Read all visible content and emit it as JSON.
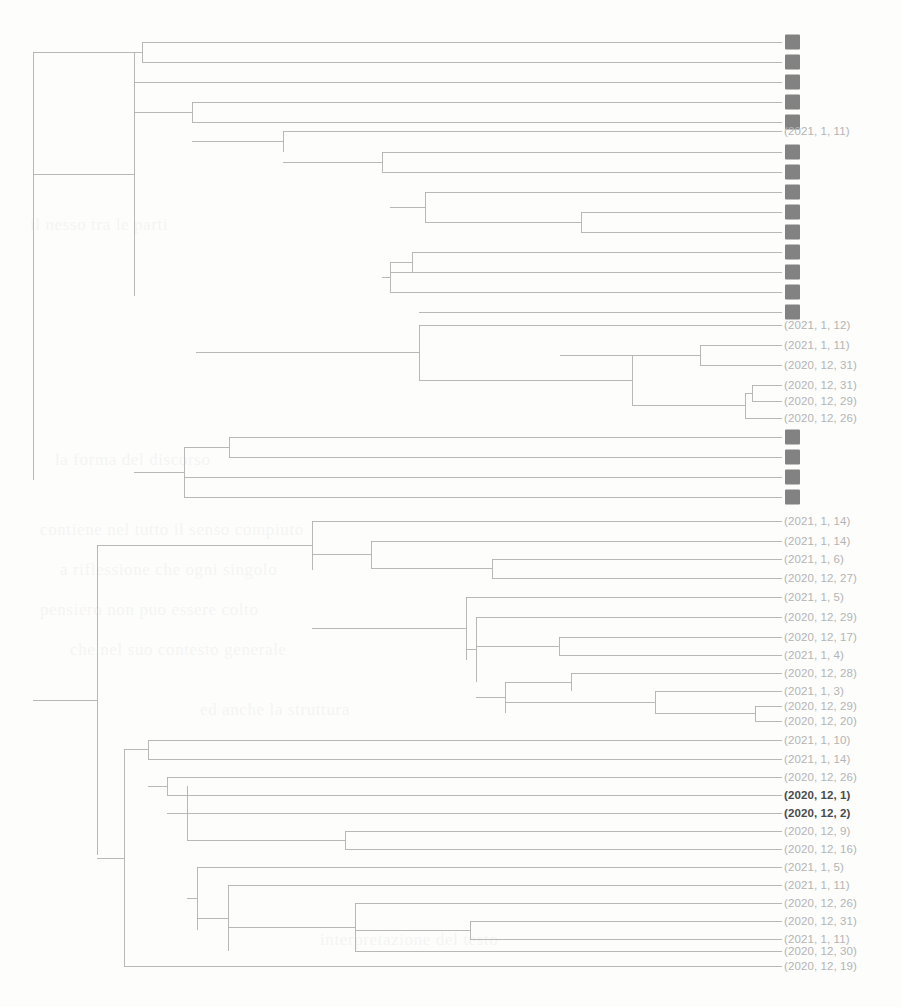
{
  "figure": {
    "type": "dendrogram",
    "title": "",
    "orientation": "left-to-right",
    "background_color": "#fdfdfc",
    "line_color": "#b0b0b0",
    "label_color": "#b4b4b4",
    "redaction_color": "#828282",
    "highlight_color": "#4a4a4a"
  },
  "chart_data": {
    "type": "dendrogram",
    "title": "",
    "xlabel": "",
    "ylabel": "",
    "orientation": "left-to-right",
    "leaf_count": 47,
    "leaf_spacing_px": 20,
    "first_leaf_y": 42,
    "leaf_x": 782,
    "root_x": 33,
    "note": "Hierarchical clustering dendrogram; 25 leaf labels are redacted (solid gray blocks), 22 show date tuples. Two labels are rendered in bold dark text.",
    "leaves": [
      {
        "index": 0,
        "y": 42,
        "label": "",
        "redacted": true,
        "bold": false,
        "branch_x": 142
      },
      {
        "index": 1,
        "y": 62,
        "label": "",
        "redacted": true,
        "bold": false,
        "branch_x": 142
      },
      {
        "index": 2,
        "y": 82,
        "label": "",
        "redacted": true,
        "bold": false,
        "branch_x": 134
      },
      {
        "index": 3,
        "y": 102,
        "label": "",
        "redacted": true,
        "bold": false,
        "branch_x": 192
      },
      {
        "index": 4,
        "y": 122,
        "label": "",
        "redacted": true,
        "bold": false,
        "branch_x": 192
      },
      {
        "index": 5,
        "y": 131,
        "label": "(2021, 1, 11)",
        "redacted": false,
        "bold": false,
        "branch_x": 283
      },
      {
        "index": 6,
        "y": 152,
        "label": "",
        "redacted": true,
        "bold": false,
        "branch_x": 382
      },
      {
        "index": 7,
        "y": 172,
        "label": "",
        "redacted": true,
        "bold": false,
        "branch_x": 382
      },
      {
        "index": 8,
        "y": 192,
        "label": "",
        "redacted": true,
        "bold": false,
        "branch_x": 425
      },
      {
        "index": 9,
        "y": 212,
        "label": "",
        "redacted": true,
        "bold": false,
        "branch_x": 581
      },
      {
        "index": 10,
        "y": 232,
        "label": "",
        "redacted": true,
        "bold": false,
        "branch_x": 581
      },
      {
        "index": 11,
        "y": 252,
        "label": "",
        "redacted": true,
        "bold": false,
        "branch_x": 412
      },
      {
        "index": 12,
        "y": 272,
        "label": "",
        "redacted": true,
        "bold": false,
        "branch_x": 390
      },
      {
        "index": 13,
        "y": 292,
        "label": "",
        "redacted": true,
        "bold": false,
        "branch_x": 390
      },
      {
        "index": 14,
        "y": 312,
        "label": "",
        "redacted": true,
        "bold": false,
        "branch_x": 419
      },
      {
        "index": 15,
        "y": 325,
        "label": "(2021, 1, 12)",
        "redacted": false,
        "bold": false,
        "branch_x": 419
      },
      {
        "index": 16,
        "y": 345,
        "label": "(2021, 1, 11)",
        "redacted": false,
        "bold": false,
        "branch_x": 700
      },
      {
        "index": 17,
        "y": 365,
        "label": "(2020, 12, 31)",
        "redacted": false,
        "bold": false,
        "branch_x": 700
      },
      {
        "index": 18,
        "y": 385,
        "label": "(2020, 12, 31)",
        "redacted": false,
        "bold": false,
        "branch_x": 752
      },
      {
        "index": 19,
        "y": 401,
        "label": "(2020, 12, 29)",
        "redacted": false,
        "bold": false,
        "branch_x": 752
      },
      {
        "index": 20,
        "y": 418,
        "label": "(2020, 12, 26)",
        "redacted": false,
        "bold": false,
        "branch_x": 745
      },
      {
        "index": 21,
        "y": 437,
        "label": "",
        "redacted": true,
        "bold": false,
        "branch_x": 229
      },
      {
        "index": 22,
        "y": 457,
        "label": "",
        "redacted": true,
        "bold": false,
        "branch_x": 229
      },
      {
        "index": 23,
        "y": 477,
        "label": "",
        "redacted": true,
        "bold": false,
        "branch_x": 184
      },
      {
        "index": 24,
        "y": 497,
        "label": "",
        "redacted": true,
        "bold": false,
        "branch_x": 184
      },
      {
        "index": 25,
        "y": 521,
        "label": "(2021, 1, 14)",
        "redacted": false,
        "bold": false,
        "branch_x": 312
      },
      {
        "index": 26,
        "y": 541,
        "label": "(2021, 1, 14)",
        "redacted": false,
        "bold": false,
        "branch_x": 371
      },
      {
        "index": 27,
        "y": 559,
        "label": "(2021, 1, 6)",
        "redacted": false,
        "bold": false,
        "branch_x": 492
      },
      {
        "index": 28,
        "y": 578,
        "label": "(2020, 12, 27)",
        "redacted": false,
        "bold": false,
        "branch_x": 492
      },
      {
        "index": 29,
        "y": 597,
        "label": "(2021, 1, 5)",
        "redacted": false,
        "bold": false,
        "branch_x": 466
      },
      {
        "index": 30,
        "y": 617,
        "label": "(2020, 12, 29)",
        "redacted": false,
        "bold": false,
        "branch_x": 476
      },
      {
        "index": 31,
        "y": 637,
        "label": "(2020, 12, 17)",
        "redacted": false,
        "bold": false,
        "branch_x": 559
      },
      {
        "index": 32,
        "y": 655,
        "label": "(2021, 1, 4)",
        "redacted": false,
        "bold": false,
        "branch_x": 559
      },
      {
        "index": 33,
        "y": 673,
        "label": "(2020, 12, 28)",
        "redacted": false,
        "bold": false,
        "branch_x": 571
      },
      {
        "index": 34,
        "y": 691,
        "label": "(2021, 1, 3)",
        "redacted": false,
        "bold": false,
        "branch_x": 655
      },
      {
        "index": 35,
        "y": 706,
        "label": "(2020, 12, 29)",
        "redacted": false,
        "bold": false,
        "branch_x": 755
      },
      {
        "index": 36,
        "y": 721,
        "label": "(2020, 12, 20)",
        "redacted": false,
        "bold": false,
        "branch_x": 755
      },
      {
        "index": 37,
        "y": 740,
        "label": "(2021, 1, 10)",
        "redacted": false,
        "bold": false,
        "branch_x": 148
      },
      {
        "index": 38,
        "y": 759,
        "label": "(2021, 1, 14)",
        "redacted": false,
        "bold": false,
        "branch_x": 148
      },
      {
        "index": 39,
        "y": 777,
        "label": "(2020, 12, 26)",
        "redacted": false,
        "bold": false,
        "branch_x": 167
      },
      {
        "index": 40,
        "y": 795,
        "label": "(2020, 12, 1)",
        "redacted": false,
        "bold": true,
        "branch_x": 167
      },
      {
        "index": 41,
        "y": 813,
        "label": "(2020, 12, 2)",
        "redacted": false,
        "bold": true,
        "branch_x": 187
      },
      {
        "index": 42,
        "y": 831,
        "label": "(2020, 12, 9)",
        "redacted": false,
        "bold": false,
        "branch_x": 345
      },
      {
        "index": 43,
        "y": 849,
        "label": "(2020, 12, 16)",
        "redacted": false,
        "bold": false,
        "branch_x": 345
      },
      {
        "index": 44,
        "y": 867,
        "label": "(2021, 1, 5)",
        "redacted": false,
        "bold": false,
        "branch_x": 197
      },
      {
        "index": 45,
        "y": 885,
        "label": "(2021, 1, 11)",
        "redacted": false,
        "bold": false,
        "branch_x": 228
      },
      {
        "index": 46,
        "y": 903,
        "label": "(2020, 12, 26)",
        "redacted": false,
        "bold": false,
        "branch_x": 355
      },
      {
        "index": 47,
        "y": 921,
        "label": "(2020, 12, 31)",
        "redacted": false,
        "bold": false,
        "branch_x": 470
      },
      {
        "index": 48,
        "y": 939,
        "label": "(2021, 1, 11)",
        "redacted": false,
        "bold": false,
        "branch_x": 470
      },
      {
        "index": 49,
        "y": 951,
        "label": "(2020, 12, 30)",
        "redacted": false,
        "bold": false,
        "branch_x": 355
      },
      {
        "index": 50,
        "y": 966,
        "label": "(2020, 12, 19)",
        "redacted": false,
        "bold": false,
        "branch_x": 124
      }
    ],
    "links": [
      {
        "x": 142,
        "y1": 42,
        "y2": 62,
        "parent_x": 33
      },
      {
        "x": 134,
        "y1": 52,
        "y2": 296,
        "parent_x": 33
      },
      {
        "x": 33,
        "y1": 52,
        "y2": 480,
        "parent_x": 33
      },
      {
        "x": 192,
        "y1": 102,
        "y2": 122,
        "parent_x": 134
      },
      {
        "x": 283,
        "y1": 131,
        "y2": 152,
        "parent_x": 192
      },
      {
        "x": 382,
        "y1": 152,
        "y2": 172,
        "parent_x": 283
      },
      {
        "x": 581,
        "y1": 212,
        "y2": 232,
        "parent_x": 425
      },
      {
        "x": 425,
        "y1": 192,
        "y2": 222,
        "parent_x": 390
      },
      {
        "x": 412,
        "y1": 252,
        "y2": 272,
        "parent_x": 390
      },
      {
        "x": 390,
        "y1": 262,
        "y2": 292,
        "parent_x": 382
      },
      {
        "x": 700,
        "y1": 345,
        "y2": 365,
        "parent_x": 560
      },
      {
        "x": 752,
        "y1": 385,
        "y2": 401,
        "parent_x": 745
      },
      {
        "x": 745,
        "y1": 393,
        "y2": 418,
        "parent_x": 632
      },
      {
        "x": 632,
        "y1": 355,
        "y2": 405,
        "parent_x": 419
      },
      {
        "x": 419,
        "y1": 325,
        "y2": 380,
        "parent_x": 196
      },
      {
        "x": 229,
        "y1": 437,
        "y2": 457,
        "parent_x": 184
      },
      {
        "x": 184,
        "y1": 447,
        "y2": 497,
        "parent_x": 134
      },
      {
        "x": 312,
        "y1": 521,
        "y2": 570,
        "parent_x": 97
      },
      {
        "x": 492,
        "y1": 559,
        "y2": 578,
        "parent_x": 371
      },
      {
        "x": 371,
        "y1": 541,
        "y2": 568,
        "parent_x": 312
      },
      {
        "x": 466,
        "y1": 597,
        "y2": 660,
        "parent_x": 312
      },
      {
        "x": 476,
        "y1": 617,
        "y2": 682,
        "parent_x": 466
      },
      {
        "x": 559,
        "y1": 637,
        "y2": 655,
        "parent_x": 476
      },
      {
        "x": 571,
        "y1": 673,
        "y2": 691,
        "parent_x": 505
      },
      {
        "x": 755,
        "y1": 706,
        "y2": 721,
        "parent_x": 655
      },
      {
        "x": 655,
        "y1": 691,
        "y2": 713,
        "parent_x": 505
      },
      {
        "x": 505,
        "y1": 682,
        "y2": 713,
        "parent_x": 476
      },
      {
        "x": 97,
        "y1": 545,
        "y2": 855,
        "parent_x": 33
      },
      {
        "x": 148,
        "y1": 740,
        "y2": 759,
        "parent_x": 124
      },
      {
        "x": 167,
        "y1": 777,
        "y2": 795,
        "parent_x": 148
      },
      {
        "x": 187,
        "y1": 786,
        "y2": 840,
        "parent_x": 167
      },
      {
        "x": 345,
        "y1": 831,
        "y2": 849,
        "parent_x": 187
      },
      {
        "x": 197,
        "y1": 867,
        "y2": 930,
        "parent_x": 187
      },
      {
        "x": 228,
        "y1": 885,
        "y2": 951,
        "parent_x": 197
      },
      {
        "x": 355,
        "y1": 903,
        "y2": 951,
        "parent_x": 228
      },
      {
        "x": 470,
        "y1": 921,
        "y2": 939,
        "parent_x": 355
      },
      {
        "x": 124,
        "y1": 750,
        "y2": 966,
        "parent_x": 97
      }
    ]
  },
  "ghost_text": [
    {
      "x": 40,
      "y": 520,
      "text": "contiene nel tutto il senso compiuto"
    },
    {
      "x": 60,
      "y": 560,
      "text": "a riflessione che ogni singolo"
    },
    {
      "x": 40,
      "y": 600,
      "text": "pensiero non puo essere colto"
    },
    {
      "x": 70,
      "y": 640,
      "text": "che nel suo contesto generale"
    },
    {
      "x": 30,
      "y": 215,
      "text": "il nesso tra le parti"
    },
    {
      "x": 55,
      "y": 450,
      "text": "la forma del discorso"
    },
    {
      "x": 200,
      "y": 700,
      "text": "ed anche la struttura"
    },
    {
      "x": 320,
      "y": 930,
      "text": "interpretazione del testo"
    }
  ]
}
